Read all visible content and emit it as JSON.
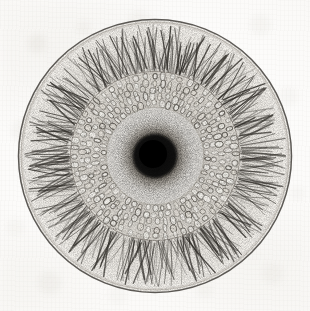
{
  "figure": {
    "kind": "scientific-engraving",
    "medium": "stipple and line engraving on aged paper",
    "caption": "",
    "title": "",
    "label": ""
  },
  "canvas": {
    "width": 310,
    "height": 311,
    "background_color": "#fbfbfa",
    "paper_tone_color": "#f4f3ef"
  },
  "geometry": {
    "center_x": 155,
    "center_y": 156,
    "outer_rim_radius": 137,
    "fibrous_zone_outer_radius": 133,
    "fibrous_zone_inner_radius": 84,
    "cell_ring_outer_radius": 84,
    "cell_ring_inner_radius": 49,
    "stipple_core_radius": 52,
    "dark_core_radius": 20
  },
  "zones": [
    {
      "name": "outer-rim-line",
      "description": "thin dark circumference outline",
      "ink_color": "#4a4742",
      "stroke_width": 1.4
    },
    {
      "name": "fibrous-cortex",
      "description": "radial flame-like hair strokes, darker at base",
      "ink_color": "#3d3a35",
      "tone": "light with dark radial fibres",
      "stroke_count": 320
    },
    {
      "name": "cell-ring",
      "description": "rounded polygonal parenchyma cells in concentric rows",
      "ink_color": "#57534c",
      "cell_rows": 5,
      "cell_count": 360,
      "tone": "light grey with outlined cells"
    },
    {
      "name": "stipple-transition",
      "description": "dot gradient fading from core outward",
      "ink_color": "#2b2824",
      "tone": "mid grey"
    },
    {
      "name": "dark-core",
      "description": "dense near-black stippled centre",
      "ink_color": "#0d0d0d",
      "tone": "near black"
    }
  ],
  "palette": {
    "ink_darkest": "#0d0d0d",
    "ink_mid": "#57534c",
    "ink_light": "#8d8880",
    "paper_white": "#ffffff",
    "paper_cream": "#f4f3ef",
    "rim_line": "#4a4742"
  }
}
